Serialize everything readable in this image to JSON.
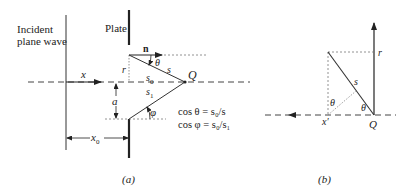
{
  "panel_a": {
    "incident_label_line1": "Incident",
    "incident_label_line2": "plane wave",
    "plate_label": "Plate",
    "n_label": "n",
    "theta_label": "θ",
    "r_label": "r",
    "s_label": "s",
    "s0_label": "s",
    "s0_sub": "0",
    "s1_label": "s",
    "s1_sub": "1",
    "q_label": "Q",
    "x_label": "x",
    "a_label": "a",
    "phi_label": "φ",
    "x0_label": "x",
    "x0_sub": "0",
    "eq1": "cos θ = s₀/s",
    "eq2": "cos φ = s₀/s₁",
    "caption": "(a)"
  },
  "panel_b": {
    "r_label": "r",
    "s_label": "s",
    "theta1_label": "θ",
    "theta2_label": "θ",
    "x_label": "x′",
    "q_label": "Q",
    "caption": "(b)"
  },
  "colors": {
    "line": "#222222",
    "dashed": "#555555",
    "dotted": "#888888"
  }
}
